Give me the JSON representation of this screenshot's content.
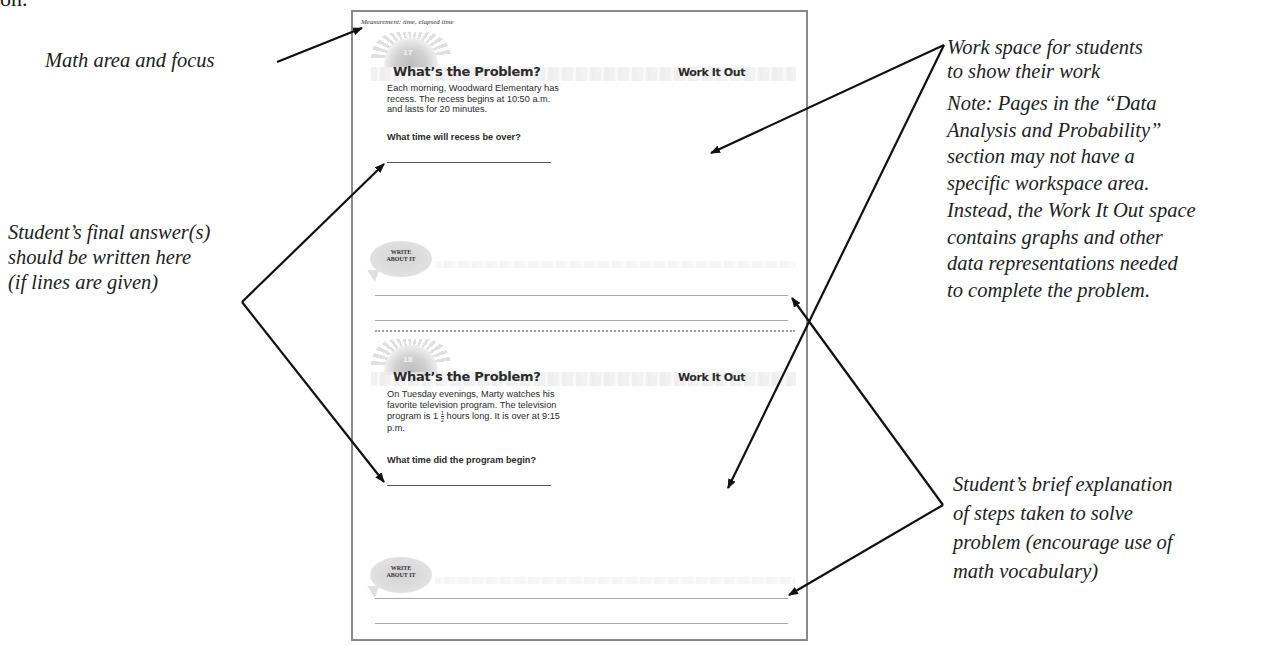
{
  "top_fragment": "on.",
  "callouts": {
    "math_area": "Math area and focus",
    "final_answer": [
      "Student’s final answer(s)",
      "should be written here",
      "(if lines are given)"
    ],
    "work_space": [
      "Work space for students",
      "to show their work"
    ],
    "note": [
      "Note:  Pages in the “Data",
      "Analysis and Probability”",
      "section may not have a",
      "specific workspace area.",
      "Instead, the Work It Out space",
      "contains graphs and other",
      "data representations needed",
      "to complete the problem."
    ],
    "explanation": [
      "Student’s brief explanation",
      "of steps taken to solve",
      "problem (encourage use of",
      "math vocabulary)"
    ]
  },
  "page": {
    "area_label": "Measurement:  time, elapsed time",
    "problems": [
      {
        "badge": "17",
        "title": "What’s the Problem?",
        "work_title": "Work It Out",
        "text": "Each morning, Woodward Elementary has recess.  The recess begins at 10:50 a.m. and lasts for 20 minutes.",
        "question": "What time will recess be over?",
        "write_about_it": [
          "WRITE",
          "ABOUT IT"
        ]
      },
      {
        "badge": "18",
        "title": "What’s the Problem?",
        "work_title": "Work It Out",
        "text_before_fraction": "On Tuesday evenings, Marty watches his favorite television program.  The television program is 1",
        "fraction": {
          "numerator": "1",
          "denominator": "2"
        },
        "text_after_fraction": " hours long. It is over at 9:15 p.m.",
        "question": "What time did the program begin?",
        "write_about_it": [
          "WRITE",
          "ABOUT IT"
        ]
      }
    ]
  },
  "colors": {
    "page_border": "#8a8a8a",
    "arrow": "#111111",
    "text": "#222222"
  }
}
